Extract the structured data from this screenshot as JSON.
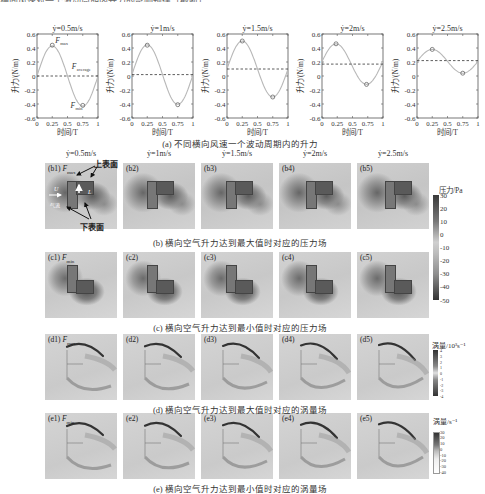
{
  "top_cut_text": "横向风速对一个波动周期内升力的影响规律（截断）",
  "section_a": {
    "caption": "(a) 不同横向风速一个波动周期内的升力",
    "ylabel": "升力/(N/m)",
    "xlabel": "时间/T",
    "yticks": [
      "0.6",
      "0.4",
      "0.2",
      "0",
      "-0.2",
      "-0.4",
      "-0.6"
    ],
    "xticks": [
      "0",
      "0.25",
      "0.5",
      "0.75",
      "1"
    ],
    "annotations": {
      "fmax": "F",
      "fmax_sub": "max",
      "fmin": "F",
      "fmin_sub": "min",
      "favg": "F",
      "favg_sub": "average"
    }
  },
  "chart_data": [
    {
      "type": "line",
      "title": "ẏ=0.5m/s",
      "xlabel": "时间/T",
      "ylabel": "升力/(N/m)",
      "ylim": [
        -0.6,
        0.6
      ],
      "xlim": [
        0,
        1
      ],
      "x": [
        0,
        0.25,
        0.5,
        0.75,
        1
      ],
      "series": [
        {
          "name": "lift",
          "values": [
            0.0,
            0.44,
            0.0,
            -0.42,
            0.0
          ]
        },
        {
          "name": "average",
          "values": [
            0.0,
            0.0,
            0.0,
            0.0,
            0.0
          ]
        }
      ],
      "markers": {
        "max": [
          0.25,
          0.44
        ],
        "min": [
          0.75,
          -0.42
        ]
      }
    },
    {
      "type": "line",
      "title": "ẏ=1m/s",
      "xlabel": "时间/T",
      "ylabel": "升力/(N/m)",
      "ylim": [
        -0.6,
        0.6
      ],
      "xlim": [
        0,
        1
      ],
      "x": [
        0,
        0.25,
        0.5,
        0.75,
        1
      ],
      "series": [
        {
          "name": "lift",
          "values": [
            0.02,
            0.44,
            0.02,
            -0.41,
            0.02
          ]
        },
        {
          "name": "average",
          "values": [
            0.02,
            0.02,
            0.02,
            0.02,
            0.02
          ]
        }
      ],
      "markers": {
        "max": [
          0.25,
          0.44
        ],
        "min": [
          0.75,
          -0.41
        ]
      }
    },
    {
      "type": "line",
      "title": "ẏ=1.5m/s",
      "xlabel": "时间/T",
      "ylabel": "升力/(N/m)",
      "ylim": [
        -0.6,
        0.6
      ],
      "xlim": [
        0,
        1
      ],
      "x": [
        0,
        0.25,
        0.5,
        0.75,
        1
      ],
      "series": [
        {
          "name": "lift",
          "values": [
            0.1,
            0.5,
            0.1,
            -0.3,
            0.1
          ]
        },
        {
          "name": "average",
          "values": [
            0.1,
            0.1,
            0.1,
            0.1,
            0.1
          ]
        }
      ],
      "markers": {
        "max": [
          0.25,
          0.5
        ],
        "min": [
          0.75,
          -0.3
        ]
      }
    },
    {
      "type": "line",
      "title": "ẏ=2m/s",
      "xlabel": "时间/T",
      "ylabel": "升力/(N/m)",
      "ylim": [
        -0.6,
        0.6
      ],
      "xlim": [
        0,
        1
      ],
      "x": [
        0,
        0.25,
        0.5,
        0.75,
        1
      ],
      "series": [
        {
          "name": "lift",
          "values": [
            0.17,
            0.46,
            0.17,
            -0.12,
            0.17
          ]
        },
        {
          "name": "average",
          "values": [
            0.17,
            0.17,
            0.17,
            0.17,
            0.17
          ]
        }
      ],
      "markers": {
        "max": [
          0.23,
          0.46
        ],
        "min": [
          0.73,
          -0.12
        ]
      }
    },
    {
      "type": "line",
      "title": "ẏ=2.5m/s",
      "xlabel": "时间/T",
      "ylabel": "升力/(N/m)",
      "ylim": [
        -0.6,
        0.6
      ],
      "xlim": [
        0,
        1
      ],
      "x": [
        0,
        0.25,
        0.5,
        0.75,
        1
      ],
      "series": [
        {
          "name": "lift",
          "values": [
            0.21,
            0.38,
            0.21,
            0.04,
            0.21
          ]
        },
        {
          "name": "average",
          "values": [
            0.22,
            0.22,
            0.22,
            0.22,
            0.22
          ]
        }
      ],
      "markers": {
        "max": [
          0.25,
          0.38
        ],
        "min": [
          0.75,
          0.04
        ]
      }
    }
  ],
  "speed_titles": [
    "ẏ=0.5m/s",
    "ẏ=1m/s",
    "ẏ=1.5m/s",
    "ẏ=2m/s",
    "ẏ=2.5m/s"
  ],
  "section_b": {
    "caption": "(b) 横向空气升力达到最大值时对应的压力场",
    "labels": [
      "(b1)",
      "(b2)",
      "(b3)",
      "(b4)",
      "(b5)"
    ],
    "first_tag": "F",
    "first_tag_sub": "max",
    "annotations": {
      "upper_surface": "上表面",
      "lower_surface": "下表面",
      "U": "U",
      "flow": "气流",
      "L": "L"
    }
  },
  "section_c": {
    "caption": "(c) 横向空气升力达到最小值时对应的压力场",
    "labels": [
      "(c1)",
      "(c2)",
      "(c3)",
      "(c4)",
      "(c5)"
    ],
    "first_tag": "F",
    "first_tag_sub": "min"
  },
  "section_d": {
    "caption": "(d) 横向空气升力达到最大值时对应的涡量场",
    "labels": [
      "(d1)",
      "(d2)",
      "(d3)",
      "(d4)",
      "(d5)"
    ],
    "first_tag": "F",
    "first_tag_sub": "max"
  },
  "section_e": {
    "caption": "(e) 横向空气升力达到最小值时对应的涡量场",
    "labels": [
      "(e1)",
      "(e2)",
      "(e3)",
      "(e4)",
      "(e5)"
    ],
    "first_tag": "F",
    "first_tag_sub": "min"
  },
  "colorbars": {
    "pressure": {
      "title": "压力/Pa",
      "ticks": [
        "30",
        "20",
        "10",
        "0",
        "-10",
        "-20",
        "-30",
        "-40",
        "-50"
      ]
    },
    "vorticity_d": {
      "title": "涡量/10³s⁻¹",
      "ticks": [
        "4",
        "3",
        "2",
        "1",
        "0",
        "-1",
        "-2",
        "-3",
        "-4"
      ]
    },
    "vorticity_e": {
      "title": "涡量/s⁻¹",
      "ticks": [
        "30",
        "20",
        "10",
        "0",
        "-10",
        "-20",
        "-30",
        "-40"
      ]
    }
  }
}
